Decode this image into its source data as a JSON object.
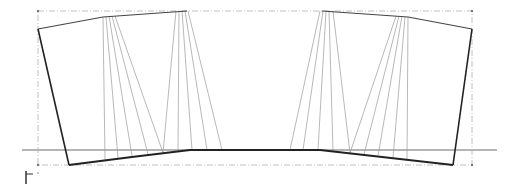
{
  "diagram": {
    "type": "pattern-draft",
    "colors": {
      "background": "#ffffff",
      "outline": "#222222",
      "slash_lines": "#9a9a9a",
      "reference_line": "#b5b5b5",
      "bounding_box": "#b0b0b0",
      "axis_marker": "#333333"
    },
    "bounding_box": {
      "x1": 38,
      "y1": 11,
      "x2": 472,
      "y2": 165
    },
    "reference_line": {
      "x1": 22,
      "x2": 497,
      "y": 150
    },
    "outline": {
      "left_edge": [
        [
          38,
          29
        ],
        [
          69,
          165
        ]
      ],
      "right_edge": [
        [
          472,
          29
        ],
        [
          453,
          165
        ]
      ],
      "top_left": [
        [
          38,
          29
        ],
        [
          103,
          17
        ],
        [
          187,
          11
        ]
      ],
      "top_right": [
        [
          322,
          11
        ],
        [
          408,
          17
        ],
        [
          472,
          29
        ]
      ],
      "bottom": [
        [
          69,
          165
        ],
        [
          130,
          156
        ],
        [
          190,
          150
        ],
        [
          320,
          150
        ],
        [
          380,
          156
        ],
        [
          453,
          165
        ]
      ]
    },
    "slash_fans": [
      {
        "top": [
          [
            103,
            17
          ],
          [
            106,
            17
          ],
          [
            109,
            16
          ],
          [
            112,
            16
          ],
          [
            115,
            16
          ]
        ],
        "bottom": [
          105,
          118,
          132,
          148,
          163
        ]
      },
      {
        "top": [
          [
            176,
            11
          ],
          [
            179,
            11
          ],
          [
            182,
            11
          ],
          [
            185,
            11
          ],
          [
            188,
            11
          ]
        ],
        "bottom": [
          163,
          178,
          192,
          207,
          222
        ]
      },
      {
        "top": [
          [
            320,
            11
          ],
          [
            323,
            11
          ],
          [
            326,
            11
          ],
          [
            329,
            11
          ],
          [
            333,
            11
          ]
        ],
        "bottom": [
          290,
          303,
          318,
          333,
          350
        ]
      },
      {
        "top": [
          [
            396,
            16
          ],
          [
            399,
            16
          ],
          [
            402,
            16
          ],
          [
            405,
            17
          ],
          [
            408,
            17
          ]
        ],
        "bottom": [
          350,
          364,
          378,
          393,
          407
        ]
      }
    ],
    "axis_marker": {
      "x": 26,
      "y": 176
    }
  }
}
